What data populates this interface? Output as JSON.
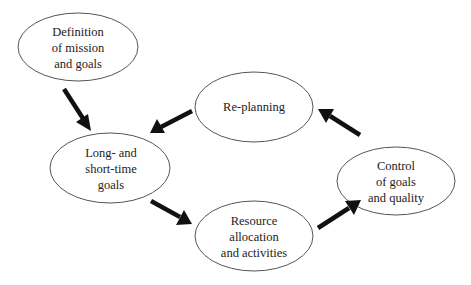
{
  "diagram": {
    "nodes": [
      {
        "id": "definition",
        "lines": [
          "Definition",
          "of mission",
          "and goals"
        ]
      },
      {
        "id": "replanning",
        "lines": [
          "Re-planning"
        ]
      },
      {
        "id": "long-short-goals",
        "lines": [
          "Long- and",
          "short-time",
          "goals"
        ]
      },
      {
        "id": "resource-allocation",
        "lines": [
          "Resource",
          "allocation",
          "and activities"
        ]
      },
      {
        "id": "control",
        "lines": [
          "Control",
          "of goals",
          "and quality"
        ]
      }
    ],
    "edges": [
      {
        "from": "definition",
        "to": "long-short-goals"
      },
      {
        "from": "replanning",
        "to": "long-short-goals"
      },
      {
        "from": "long-short-goals",
        "to": "resource-allocation"
      },
      {
        "from": "resource-allocation",
        "to": "control"
      },
      {
        "from": "control",
        "to": "replanning"
      }
    ]
  }
}
